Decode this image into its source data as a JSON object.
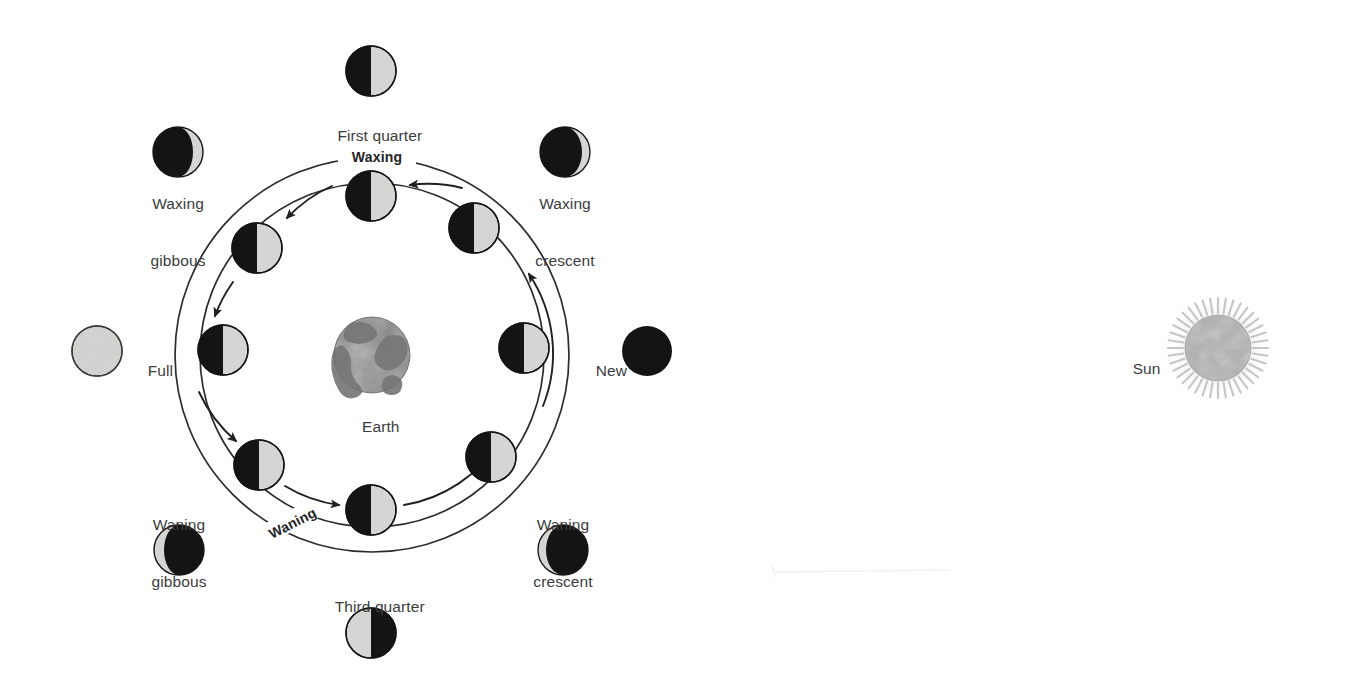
{
  "diagram": {
    "background_color": "#ffffff",
    "text_color": "#3c3c3e",
    "line_color": "#2b2b2d",
    "moon_light_color": "#d5d5d3",
    "moon_dark_color": "#141414",
    "earth_color": "#8a8a8a",
    "sun_color": "#b9b9b9"
  },
  "center_body": {
    "name": "Earth",
    "label": "Earth",
    "cx": 372,
    "cy": 355,
    "r": 38
  },
  "sun_body": {
    "name": "Sun",
    "label": "Sun",
    "cx": 1218,
    "cy": 348,
    "r": 33,
    "corona_r": 54
  },
  "orbit": {
    "cx": 372,
    "cy": 355,
    "outer_r": 197,
    "inner_r": 172,
    "arc_labels": [
      {
        "text": "Waxing",
        "position": "top",
        "angle_deg": -90
      },
      {
        "text": "Waning",
        "position": "bottom-left",
        "angle_deg": 122
      }
    ]
  },
  "orbit_moons": [
    {
      "id": "orbit-new",
      "label": "",
      "cx": 524,
      "cy": 348,
      "r": 25,
      "phase": "half-light-right",
      "angle_deg": 0
    },
    {
      "id": "orbit-waxing-crescent",
      "label": "",
      "cx": 474,
      "cy": 228,
      "r": 25,
      "phase": "half-light-right",
      "angle_deg": 315
    },
    {
      "id": "orbit-first-quarter",
      "label": "",
      "cx": 371,
      "cy": 196,
      "r": 25,
      "phase": "half-light-right",
      "angle_deg": 270
    },
    {
      "id": "orbit-waxing-gibbous",
      "label": "",
      "cx": 257,
      "cy": 248,
      "r": 25,
      "phase": "half-light-right",
      "angle_deg": 225
    },
    {
      "id": "orbit-full",
      "label": "",
      "cx": 223,
      "cy": 350,
      "r": 25,
      "phase": "half-light-right",
      "angle_deg": 180
    },
    {
      "id": "orbit-waning-gibbous",
      "label": "",
      "cx": 259,
      "cy": 465,
      "r": 25,
      "phase": "half-light-right",
      "angle_deg": 135
    },
    {
      "id": "orbit-third-quarter",
      "label": "",
      "cx": 371,
      "cy": 510,
      "r": 25,
      "phase": "half-light-right",
      "angle_deg": 90
    },
    {
      "id": "orbit-waning-crescent",
      "label": "",
      "cx": 491,
      "cy": 457,
      "r": 25,
      "phase": "half-light-right",
      "angle_deg": 45
    }
  ],
  "phase_callouts": [
    {
      "id": "first-quarter",
      "label": "First quarter",
      "label_lines": [
        "First quarter"
      ],
      "label_x": 371,
      "label_y": 107,
      "cx": 371,
      "cy": 71,
      "r": 25,
      "phase": "half-light-right"
    },
    {
      "id": "waxing-gibbous",
      "label": "Waxing gibbous",
      "label_lines": [
        "Waxing",
        "gibbous"
      ],
      "label_x": 178,
      "label_y": 186,
      "cx": 178,
      "cy": 152,
      "r": 25,
      "phase": "gibbous-light-right"
    },
    {
      "id": "waxing-crescent",
      "label": "Waxing crescent",
      "label_lines": [
        "Waxing",
        "crescent"
      ],
      "label_x": 565,
      "label_y": 186,
      "cx": 565,
      "cy": 152,
      "r": 25,
      "phase": "crescent-light-right"
    },
    {
      "id": "full",
      "label": "Full",
      "label_lines": [
        "Full"
      ],
      "label_x": 130,
      "label_y": 343,
      "label_align": "left",
      "cx": 97,
      "cy": 351,
      "r": 25,
      "phase": "full-light"
    },
    {
      "id": "new",
      "label": "New",
      "label_lines": [
        "New"
      ],
      "label_x": 578,
      "label_y": 343,
      "label_align": "left",
      "cx": 647,
      "cy": 351,
      "r": 25,
      "phase": "new-dark"
    },
    {
      "id": "waning-gibbous",
      "label": "Waning gibbous",
      "label_lines": [
        "Waning",
        "gibbous"
      ],
      "label_x": 179,
      "label_y": 478,
      "cx": 179,
      "cy": 550,
      "r": 25,
      "phase": "gibbous-light-left"
    },
    {
      "id": "waning-crescent",
      "label": "Waning crescent",
      "label_lines": [
        "Waning",
        "crescent"
      ],
      "label_x": 563,
      "label_y": 478,
      "cx": 563,
      "cy": 550,
      "r": 25,
      "phase": "crescent-light-left"
    },
    {
      "id": "third-quarter",
      "label": "Third quarter",
      "label_lines": [
        "Third quarter"
      ],
      "label_x": 371,
      "label_y": 578,
      "cx": 371,
      "cy": 633,
      "r": 25,
      "phase": "half-light-left"
    }
  ],
  "flow_arrows": [
    {
      "id": "arrow-new-to-waxing-crescent",
      "direction": "counterclockwise"
    },
    {
      "id": "arrow-waxing-crescent-to-first",
      "direction": "counterclockwise"
    },
    {
      "id": "arrow-first-to-waxing-gibbous",
      "direction": "counterclockwise"
    },
    {
      "id": "arrow-waxing-gibbous-to-full",
      "direction": "counterclockwise"
    },
    {
      "id": "arrow-full-to-waning-gibbous",
      "direction": "counterclockwise"
    },
    {
      "id": "arrow-waning-gibbous-to-third",
      "direction": "counterclockwise"
    },
    {
      "id": "arrow-third-to-waning-crescent",
      "direction": "counterclockwise"
    }
  ]
}
